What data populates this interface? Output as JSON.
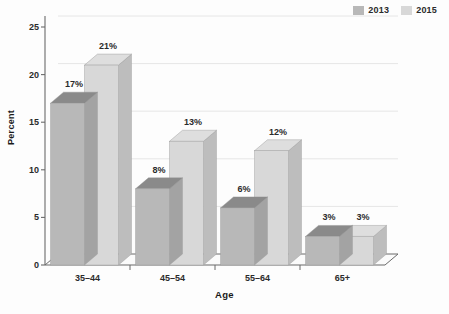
{
  "chart_data": {
    "type": "bar",
    "title": "",
    "subtitle": "",
    "xlabel": "Age",
    "ylabel": "Percent",
    "categories": [
      "35–44",
      "45–54",
      "55–64",
      "65+"
    ],
    "series": [
      {
        "name": "2013",
        "color": "#b8b8b8",
        "values": [
          17,
          8,
          6,
          3
        ],
        "value_labels": [
          "17%",
          "8%",
          "6%",
          "3%"
        ]
      },
      {
        "name": "2015",
        "color": "#d8d8d8",
        "values": [
          21,
          13,
          12,
          3
        ],
        "value_labels": [
          "21%",
          "13%",
          "12%",
          "3%"
        ]
      }
    ],
    "ylim": [
      0,
      25
    ],
    "yticks": [
      0,
      5,
      10,
      15,
      20,
      25
    ],
    "ytick_labels": [
      "0",
      "5",
      "10",
      "15",
      "20",
      "25"
    ],
    "grid": true,
    "grid_axis": "y",
    "legend_position": "top-right",
    "three_d": true,
    "value_labels_shown": true
  },
  "legend": {
    "entries": [
      {
        "label": "2013",
        "color": "#b8b8b8"
      },
      {
        "label": "2015",
        "color": "#d8d8d8"
      }
    ]
  },
  "colors": {
    "series_2013_front": "#b8b8b8",
    "series_2013_top": "#8a8a8a",
    "series_2013_side": "#a3a3a3",
    "series_2015_front": "#d8d8d8",
    "series_2015_top": "#dedede",
    "series_2015_side": "#bdbdbd",
    "axis": "#6b6b6b",
    "grid": "#e6e6e6",
    "floor": "#fbfbfb",
    "text": "#2b2b2b",
    "background": "#fdfdfd"
  }
}
